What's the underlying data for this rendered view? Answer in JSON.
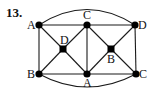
{
  "problem_number": "13.",
  "nodes": [
    {
      "id": "n1",
      "label": "A",
      "x": 39,
      "y": 25,
      "shape": "circle",
      "label_x": 27,
      "label_y": 29,
      "anchor": "end-left"
    },
    {
      "id": "n2",
      "label": "C",
      "x": 87,
      "y": 25,
      "shape": "circle",
      "label_x": 83,
      "label_y": 19,
      "anchor": "top"
    },
    {
      "id": "n3",
      "label": "D",
      "x": 135,
      "y": 25,
      "shape": "circle",
      "label_x": 138,
      "label_y": 29,
      "anchor": "right"
    },
    {
      "id": "n4",
      "label": "D",
      "x": 63,
      "y": 49,
      "shape": "square",
      "label_x": 60,
      "label_y": 44,
      "anchor": "top"
    },
    {
      "id": "n5",
      "label": "B",
      "x": 111,
      "y": 49,
      "shape": "square",
      "label_x": 107,
      "label_y": 63,
      "anchor": "bottom"
    },
    {
      "id": "n6",
      "label": "B",
      "x": 39,
      "y": 74,
      "shape": "circle",
      "label_x": 27,
      "label_y": 78,
      "anchor": "left"
    },
    {
      "id": "n7",
      "label": "A",
      "x": 87,
      "y": 74,
      "shape": "circle",
      "label_x": 83,
      "label_y": 87,
      "anchor": "bottom"
    },
    {
      "id": "n8",
      "label": "C",
      "x": 136,
      "y": 74,
      "shape": "circle",
      "label_x": 139,
      "label_y": 78,
      "anchor": "right"
    }
  ],
  "edges": [
    [
      "n1",
      "n2"
    ],
    [
      "n2",
      "n3"
    ],
    [
      "n6",
      "n7"
    ],
    [
      "n7",
      "n8"
    ],
    [
      "n1",
      "n6"
    ],
    [
      "n3",
      "n8"
    ],
    [
      "n2",
      "n7"
    ],
    [
      "n1",
      "n4"
    ],
    [
      "n4",
      "n7"
    ],
    [
      "n2",
      "n4"
    ],
    [
      "n4",
      "n6"
    ],
    [
      "n2",
      "n5"
    ],
    [
      "n5",
      "n8"
    ],
    [
      "n3",
      "n5"
    ],
    [
      "n5",
      "n7"
    ]
  ],
  "arcs": [
    {
      "from": "n1",
      "to": "n3",
      "path": "M39,25 Q87,-6 135,25"
    },
    {
      "from": "n6",
      "to": "n8",
      "path": "M39,74 Q87,100 136,74"
    }
  ]
}
